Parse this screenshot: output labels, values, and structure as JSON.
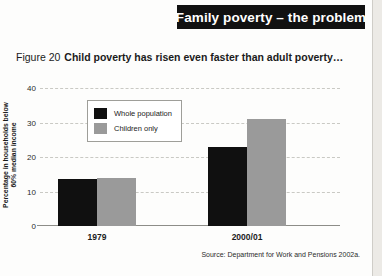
{
  "banner": {
    "title": "Family poverty – the problem"
  },
  "caption": {
    "figure_number": "Figure 20",
    "text": "Child poverty has risen even faster than adult poverty…"
  },
  "source": {
    "text": "Source: Department for Work and Pensions 2002a."
  },
  "legend": {
    "items": [
      {
        "label": "Whole population",
        "color": "#101010"
      },
      {
        "label": "Children only",
        "color": "#9a9a9a"
      }
    ]
  },
  "chart_data": {
    "type": "bar",
    "title": "Child poverty has risen even faster than adult poverty…",
    "xlabel": "",
    "ylabel": "Percentage in households below 60% median income",
    "ylabel_line1": "Percentage in households below",
    "ylabel_line2": "60% median income",
    "categories": [
      "1979",
      "2000/01"
    ],
    "ylim": [
      0,
      40
    ],
    "yticks": [
      0,
      10,
      20,
      30,
      40
    ],
    "ytick_labels": [
      "0",
      "10",
      "20",
      "30",
      "40"
    ],
    "grid": true,
    "legend_position": "upper-left-inside",
    "series": [
      {
        "name": "Whole population",
        "color": "#101010",
        "values": [
          13.5,
          23
        ]
      },
      {
        "name": "Children only",
        "color": "#9a9a9a",
        "values": [
          14,
          31
        ]
      }
    ]
  }
}
